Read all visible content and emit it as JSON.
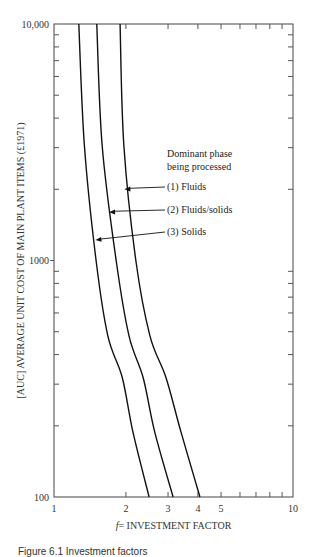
{
  "chart_data": {
    "type": "line",
    "title": "",
    "xlabel_italic": "f",
    "xlabel": "= INVESTMENT FACTOR",
    "ylabel": "[AUC] AVERAGE UNIT COST OF MAIN PLANT ITEMS (£1971)",
    "xscale": "log",
    "yscale": "log",
    "xlim": [
      1,
      10
    ],
    "ylim": [
      100,
      10000
    ],
    "x_tick_labels": [
      {
        "value": 1,
        "label": "1"
      },
      {
        "value": 2,
        "label": "2"
      },
      {
        "value": 3,
        "label": "3"
      },
      {
        "value": 4,
        "label": "4"
      },
      {
        "value": 5,
        "label": "5"
      },
      {
        "value": 10,
        "label": "10"
      }
    ],
    "x_minor_ticks": [
      2,
      3,
      4,
      5,
      6,
      7,
      8,
      9
    ],
    "y_tick_labels": [
      {
        "value": 100,
        "label": "100"
      },
      {
        "value": 1000,
        "label": "1000"
      },
      {
        "value": 10000,
        "label": "10,000"
      }
    ],
    "y_minor_ticks": [
      200,
      300,
      400,
      500,
      600,
      700,
      800,
      900,
      2000,
      3000,
      4000,
      5000,
      6000,
      7000,
      8000,
      9000
    ],
    "grid": false,
    "legend_title": [
      "Dominant phase",
      "being processed"
    ],
    "series": [
      {
        "name": "(1) Fluids",
        "points": [
          [
            1.89,
            10000
          ],
          [
            1.96,
            3070
          ],
          [
            2.2,
            1000
          ],
          [
            2.52,
            480
          ],
          [
            2.94,
            320
          ],
          [
            3.4,
            188
          ],
          [
            4.08,
            100
          ]
        ],
        "label_anchor": [
          1.97,
          2000
        ]
      },
      {
        "name": "(2) Fluids/solids",
        "points": [
          [
            1.51,
            10000
          ],
          [
            1.59,
            3070
          ],
          [
            1.82,
            1000
          ],
          [
            2.06,
            480
          ],
          [
            2.36,
            320
          ],
          [
            2.64,
            188
          ],
          [
            3.15,
            100
          ]
        ],
        "label_anchor": [
          1.7,
          1600
        ]
      },
      {
        "name": "(3) Solids",
        "points": [
          [
            1.27,
            10000
          ],
          [
            1.34,
            3070
          ],
          [
            1.5,
            1000
          ],
          [
            1.68,
            480
          ],
          [
            1.93,
            320
          ],
          [
            2.14,
            188
          ],
          [
            2.5,
            100
          ]
        ],
        "label_anchor": [
          1.49,
          1220
        ]
      }
    ]
  },
  "caption": "Figure 6.1  Investment factors"
}
